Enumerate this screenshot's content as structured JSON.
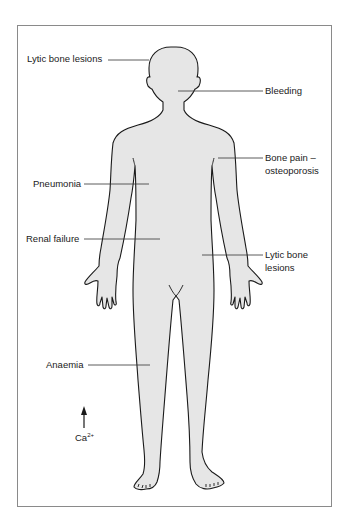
{
  "figure": {
    "body_fill": "#e6e6e6",
    "outline_color": "#1a1a1a",
    "frame_color": "#8a8a8a",
    "labels": [
      {
        "id": "lytic-head",
        "text": "Lytic bone lesions"
      },
      {
        "id": "bleeding",
        "text": "Bleeding"
      },
      {
        "id": "bone-pain",
        "line1": "Bone pain –",
        "line2": "osteoporosis"
      },
      {
        "id": "pneumonia",
        "text": "Pneumonia"
      },
      {
        "id": "renal",
        "text": "Renal failure"
      },
      {
        "id": "lytic-pelvis",
        "line1": "Lytic bone",
        "line2": "lesions"
      },
      {
        "id": "anaemia",
        "text": "Anaemia"
      }
    ],
    "calcium": {
      "symbol": "Ca",
      "charge": "2+",
      "arrow": "up"
    }
  }
}
